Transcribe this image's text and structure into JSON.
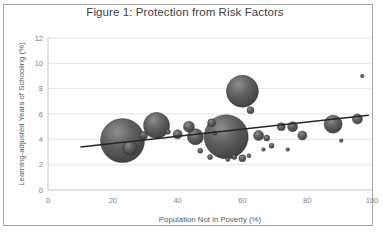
{
  "chart_data": {
    "type": "scatter",
    "title": "Figure 1: Protection from Risk Factors",
    "xlabel": "Population Not in Poverty (%)",
    "ylabel": "Learning-adjusted Years of Schooling (%)",
    "xlim": [
      0,
      100
    ],
    "ylim": [
      0,
      12
    ],
    "xticks": [
      0,
      20,
      40,
      60,
      80,
      100
    ],
    "yticks": [
      0,
      2,
      4,
      6,
      8,
      10,
      12
    ],
    "grid": true,
    "legend": "none",
    "bubble_chart": true,
    "points": [
      {
        "x": 23.0,
        "y": 3.9,
        "r": 22
      },
      {
        "x": 33.5,
        "y": 5.1,
        "r": 13
      },
      {
        "x": 25.3,
        "y": 3.3,
        "r": 7
      },
      {
        "x": 29.5,
        "y": 4.3,
        "r": 4
      },
      {
        "x": 37.0,
        "y": 4.6,
        "r": 2.5
      },
      {
        "x": 40.0,
        "y": 4.4,
        "r": 4.5
      },
      {
        "x": 43.5,
        "y": 5.0,
        "r": 5.5
      },
      {
        "x": 45.5,
        "y": 4.2,
        "r": 8
      },
      {
        "x": 47.0,
        "y": 3.1,
        "r": 2.5
      },
      {
        "x": 50.5,
        "y": 5.3,
        "r": 4
      },
      {
        "x": 51.5,
        "y": 4.5,
        "r": 2
      },
      {
        "x": 55.0,
        "y": 4.2,
        "r": 22
      },
      {
        "x": 60.0,
        "y": 7.8,
        "r": 16
      },
      {
        "x": 62.5,
        "y": 6.3,
        "r": 3.5
      },
      {
        "x": 50.0,
        "y": 2.6,
        "r": 2.5
      },
      {
        "x": 55.5,
        "y": 2.4,
        "r": 2
      },
      {
        "x": 57.5,
        "y": 2.6,
        "r": 2.5
      },
      {
        "x": 60.0,
        "y": 2.5,
        "r": 3.5
      },
      {
        "x": 62.0,
        "y": 2.7,
        "r": 2
      },
      {
        "x": 65.0,
        "y": 4.3,
        "r": 5
      },
      {
        "x": 67.5,
        "y": 4.1,
        "r": 3
      },
      {
        "x": 69.0,
        "y": 3.5,
        "r": 2.5
      },
      {
        "x": 72.0,
        "y": 5.0,
        "r": 4
      },
      {
        "x": 75.5,
        "y": 5.0,
        "r": 5
      },
      {
        "x": 78.5,
        "y": 4.3,
        "r": 4.5
      },
      {
        "x": 74.0,
        "y": 3.2,
        "r": 1.8
      },
      {
        "x": 66.5,
        "y": 3.2,
        "r": 1.8
      },
      {
        "x": 88.0,
        "y": 5.2,
        "r": 9
      },
      {
        "x": 90.5,
        "y": 3.9,
        "r": 1.8
      },
      {
        "x": 95.5,
        "y": 5.6,
        "r": 5
      },
      {
        "x": 97.0,
        "y": 9.0,
        "r": 1.8
      }
    ],
    "trendline": {
      "x0": 10.0,
      "y0": 3.4,
      "x1": 99.0,
      "y1": 5.9
    }
  }
}
